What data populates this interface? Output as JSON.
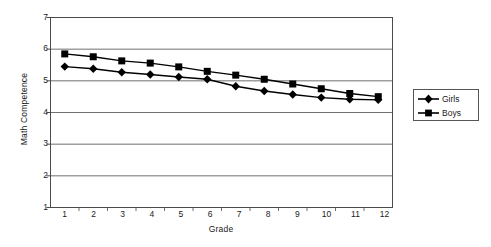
{
  "chart_data": {
    "type": "line",
    "title": "",
    "xlabel": "Grade",
    "ylabel": "Math Competence",
    "categories": [
      1,
      2,
      3,
      4,
      5,
      6,
      7,
      8,
      9,
      10,
      11,
      12
    ],
    "x": [
      1,
      2,
      3,
      4,
      5,
      6,
      7,
      8,
      9,
      10,
      11,
      12
    ],
    "xlim": [
      0.5,
      12.5
    ],
    "ylim": [
      1,
      7
    ],
    "yticks": [
      1,
      2,
      3,
      4,
      5,
      6,
      7
    ],
    "xticks": [
      1,
      2,
      3,
      4,
      5,
      6,
      7,
      8,
      9,
      10,
      11,
      12
    ],
    "grid": "horizontal",
    "legend_position": "right",
    "series": [
      {
        "name": "Girls",
        "marker": "diamond",
        "color": "#000000",
        "values": [
          5.45,
          5.38,
          5.27,
          5.2,
          5.12,
          5.05,
          4.83,
          4.68,
          4.57,
          4.47,
          4.42,
          4.4
        ]
      },
      {
        "name": "Boys",
        "marker": "square",
        "color": "#000000",
        "values": [
          5.85,
          5.76,
          5.63,
          5.56,
          5.44,
          5.3,
          5.18,
          5.05,
          4.9,
          4.75,
          4.6,
          4.5
        ]
      }
    ]
  },
  "axes": {
    "y_title": "Math Competence",
    "x_title": "Grade",
    "y_tick_labels": [
      "7",
      "6",
      "5",
      "4",
      "3",
      "2",
      "1"
    ],
    "x_tick_labels": [
      "1",
      "2",
      "3",
      "4",
      "5",
      "6",
      "7",
      "8",
      "9",
      "10",
      "11",
      "12"
    ]
  },
  "legend": {
    "items": [
      {
        "label": "Girls",
        "marker": "diamond"
      },
      {
        "label": "Boys",
        "marker": "square"
      }
    ]
  }
}
